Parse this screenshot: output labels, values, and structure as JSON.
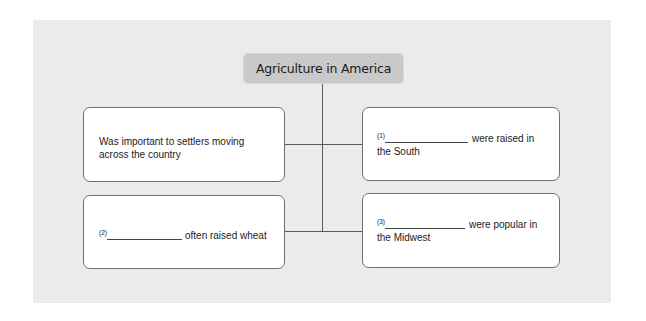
{
  "diagram": {
    "title": "Agriculture in America",
    "colors": {
      "panel_background": "#ebebea",
      "title_fill": "#c9c9c9",
      "box_fill": "#ffffff",
      "box_border": "#6e6e6e",
      "connector": "#5a5a5a"
    },
    "nodes": [
      {
        "id": "top-left",
        "text_line1": "Was important to settlers moving",
        "text_line2": "across the country"
      },
      {
        "id": "top-right",
        "number": "(1)",
        "text_after_blank": "were raised in",
        "text_line2": "the South"
      },
      {
        "id": "bottom-left",
        "number": "(2)",
        "text_after_blank": "often raised wheat"
      },
      {
        "id": "bottom-right",
        "number": "(3)",
        "text_after_blank": "were popular in",
        "text_line2": "the Midwest"
      }
    ]
  }
}
